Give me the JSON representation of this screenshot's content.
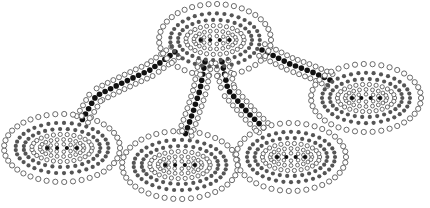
{
  "diagram": {
    "type": "dot-art-network",
    "colors": {
      "background": "#ffffff",
      "hollow_stroke": "#5a5a5a",
      "gray_dot": "#555555",
      "black_dot": "#111111"
    },
    "hub": {
      "id": "top",
      "cx": 215,
      "cy": 40,
      "rx": 56,
      "ry": 36
    },
    "nodes": [
      {
        "id": "left",
        "cx": 62,
        "cy": 148,
        "rx": 58,
        "ry": 34
      },
      {
        "id": "center-left",
        "cx": 180,
        "cy": 165,
        "rx": 58,
        "ry": 34
      },
      {
        "id": "center-right",
        "cx": 291,
        "cy": 157,
        "rx": 55,
        "ry": 34
      },
      {
        "id": "right",
        "cx": 366,
        "cy": 98,
        "rx": 55,
        "ry": 34
      }
    ],
    "paths": [
      {
        "to": "left",
        "points": [
          [
            175,
            52
          ],
          [
            150,
            70
          ],
          [
            120,
            84
          ],
          [
            96,
            96
          ],
          [
            82,
            120
          ]
        ]
      },
      {
        "to": "center-left",
        "points": [
          [
            205,
            62
          ],
          [
            200,
            90
          ],
          [
            192,
            115
          ],
          [
            185,
            135
          ]
        ]
      },
      {
        "to": "center-right",
        "points": [
          [
            222,
            62
          ],
          [
            228,
            90
          ],
          [
            250,
            115
          ],
          [
            268,
            132
          ]
        ]
      },
      {
        "to": "right",
        "points": [
          [
            262,
            50
          ],
          [
            290,
            64
          ],
          [
            312,
            72
          ],
          [
            330,
            80
          ]
        ]
      }
    ]
  }
}
